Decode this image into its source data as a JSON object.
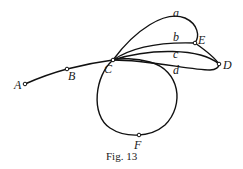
{
  "figure": {
    "caption": "Fig. 13",
    "nodes": {
      "A": {
        "label": "A"
      },
      "B": {
        "label": "B"
      },
      "C": {
        "label": "C"
      },
      "D": {
        "label": "D"
      },
      "E": {
        "label": "E"
      },
      "F": {
        "label": "F"
      }
    },
    "edges": {
      "a": {
        "label": "a"
      },
      "b": {
        "label": "b"
      },
      "c": {
        "label": "c"
      },
      "d": {
        "label": "d"
      }
    },
    "colors": {
      "ink": "#111111",
      "background": "#ffffff"
    }
  }
}
